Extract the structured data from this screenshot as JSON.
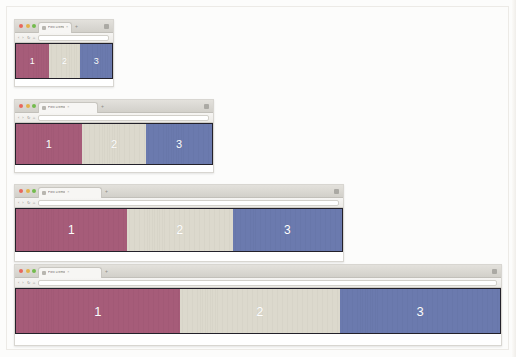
{
  "browser_chrome": {
    "traffic_lights": [
      "close-red",
      "minimize-yellow",
      "maximize-green"
    ],
    "tab_title": "Flex Demo",
    "tab_close_label": "×",
    "new_tab_label": "+",
    "menu_icon": "hamburger-menu-icon",
    "nav_back_label": "‹",
    "nav_forward_label": "›",
    "nav_reload_label": "↻",
    "nav_home_label": "⌂",
    "omnibox_value": "",
    "omnibox_placeholder": ""
  },
  "colors": {
    "panel_1": "#a65c79",
    "panel_2": "#dcd9cd",
    "panel_3": "#6b7aae",
    "frame": "#23212a",
    "page_background": "#fcfcfb",
    "label_text": "#ffffff"
  },
  "panels": [
    {
      "label": "1",
      "color_key": "panel_1",
      "name": "flex-panel-1"
    },
    {
      "label": "2",
      "color_key": "panel_2",
      "name": "flex-panel-2"
    },
    {
      "label": "3",
      "color_key": "panel_3",
      "name": "flex-panel-3"
    }
  ],
  "windows": [
    {
      "name": "browser-window-1",
      "size_label": "small",
      "x": 14,
      "y": 19,
      "width": 100,
      "height": 68,
      "viewport_height": 36,
      "content_height": 10,
      "panel_widths": [
        34,
        33,
        33
      ],
      "label_font_size": 9
    },
    {
      "name": "browser-window-2",
      "size_label": "medium",
      "x": 14,
      "y": 99,
      "width": 200,
      "height": 74,
      "viewport_height": 42,
      "content_height": 10,
      "panel_widths": [
        33.5,
        33.0,
        33.5
      ],
      "label_font_size": 11
    },
    {
      "name": "browser-window-3",
      "size_label": "large",
      "x": 14,
      "y": 184,
      "width": 330,
      "height": 78,
      "viewport_height": 44,
      "content_height": 11,
      "panel_widths": [
        34.0,
        32.5,
        33.5
      ],
      "label_font_size": 12
    },
    {
      "name": "browser-window-4",
      "size_label": "extra-large",
      "x": 14,
      "y": 264,
      "width": 488,
      "height": 82,
      "viewport_height": 46,
      "content_height": 12,
      "panel_widths": [
        33.8,
        33.2,
        33.0
      ],
      "label_font_size": 13
    }
  ]
}
